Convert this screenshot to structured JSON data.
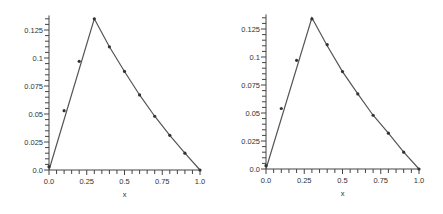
{
  "chart_data": [
    {
      "type": "line",
      "title": "",
      "xlabel": "x",
      "ylabel": "",
      "xlim": [
        0.0,
        1.0
      ],
      "ylim": [
        0.0,
        0.135
      ],
      "x_ticks": [
        "0.0",
        "0.25",
        "0.5",
        "0.75",
        "1.0"
      ],
      "y_ticks": [
        "0.0",
        "0.025",
        "0.05",
        "0.075",
        "0.1",
        "0.125"
      ],
      "grid": false,
      "series": [
        {
          "name": "curve",
          "style": "line",
          "x": [
            0.0,
            0.3,
            0.4,
            0.5,
            0.6,
            0.7,
            0.8,
            0.9,
            1.0
          ],
          "y": [
            0.0,
            0.135,
            0.11,
            0.088,
            0.067,
            0.048,
            0.031,
            0.015,
            0.0
          ]
        },
        {
          "name": "points",
          "style": "markers",
          "x": [
            0.0,
            0.1,
            0.2,
            0.3,
            0.4,
            0.5,
            0.6,
            0.7,
            0.8,
            0.9,
            1.0
          ],
          "y": [
            0.003,
            0.053,
            0.097,
            0.135,
            0.11,
            0.088,
            0.067,
            0.048,
            0.031,
            0.015,
            0.0
          ]
        }
      ]
    },
    {
      "type": "line",
      "title": "",
      "xlabel": "x",
      "ylabel": "",
      "xlim": [
        0.0,
        1.0
      ],
      "ylim": [
        0.0,
        0.135
      ],
      "x_ticks": [
        "0.0",
        "0.25",
        "0.5",
        "0.75",
        "1.0"
      ],
      "y_ticks": [
        "0.0",
        "0.025",
        "0.05",
        "0.075",
        "0.1",
        "0.125"
      ],
      "grid": false,
      "series": [
        {
          "name": "curve",
          "style": "line",
          "x": [
            0.0,
            0.3,
            0.4,
            0.5,
            0.6,
            0.7,
            0.8,
            0.9,
            1.0
          ],
          "y": [
            0.0,
            0.135,
            0.11,
            0.087,
            0.067,
            0.048,
            0.032,
            0.015,
            0.0
          ]
        },
        {
          "name": "points",
          "style": "markers",
          "x": [
            0.0,
            0.1,
            0.2,
            0.3,
            0.4,
            0.5,
            0.6,
            0.7,
            0.8,
            0.9,
            1.0
          ],
          "y": [
            0.003,
            0.054,
            0.097,
            0.134,
            0.111,
            0.087,
            0.067,
            0.048,
            0.032,
            0.015,
            0.0
          ]
        }
      ]
    }
  ]
}
